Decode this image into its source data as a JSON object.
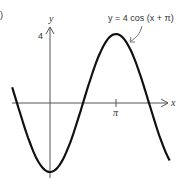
{
  "figure_label_fragment": ")",
  "chart_data": {
    "type": "line",
    "title": "",
    "equation_label": "y = 4 cos (x + π)",
    "xlabel": "x",
    "ylabel": "y",
    "x_ticks": [
      {
        "value": 3.14159,
        "label": "π"
      }
    ],
    "y_ticks": [
      {
        "value": 4,
        "label": "4"
      }
    ],
    "xlim": [
      -1.8,
      5.7
    ],
    "ylim": [
      -4,
      4
    ],
    "grid": false,
    "series": [
      {
        "name": "y = 4 cos (x + π)",
        "x": [
          -1.8,
          -1.5708,
          -0.7854,
          0,
          0.7854,
          1.5708,
          2.3562,
          3.14159,
          3.927,
          4.7124,
          5.4978,
          5.7
        ],
        "values": [
          0.91,
          0,
          -2.83,
          -4,
          -2.83,
          0,
          2.83,
          4,
          2.83,
          0,
          -2.83,
          -3.35
        ]
      }
    ],
    "annotations": [
      {
        "text": "y = 4 cos (x + π)",
        "arrow_to": {
          "x": 3.8,
          "y": 3.1
        }
      }
    ]
  },
  "labels": {
    "y_axis": "y",
    "x_axis": "x",
    "y_tick": "4",
    "x_tick": "π",
    "equation": "y = 4 cos (x + π)"
  }
}
